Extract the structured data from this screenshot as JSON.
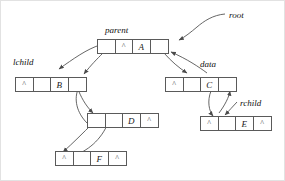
{
  "diagram": {
    "nil_glyph": "^",
    "colors": {
      "box_border": "#5a5a5a",
      "wire": "#4a4a4a",
      "text": "#111111",
      "background": "#ffffff",
      "frame": "#e2e2e2"
    },
    "annotations": [
      {
        "id": "root",
        "text": "root",
        "x": 228,
        "y": 9
      },
      {
        "id": "parent",
        "text": "parent",
        "x": 104,
        "y": 24
      },
      {
        "id": "lchild",
        "text": "lchild",
        "x": 12,
        "y": 56
      },
      {
        "id": "data",
        "text": "data",
        "x": 199,
        "y": 58
      },
      {
        "id": "rchild",
        "text": "rchild",
        "x": 239,
        "y": 97
      }
    ],
    "nodes": [
      {
        "id": "node-a",
        "data": "A",
        "x": 96,
        "y": 38,
        "cells": [
          {
            "role": "parent",
            "kind": "pointer",
            "text": ""
          },
          {
            "role": "lchild",
            "kind": "nil",
            "text": "^"
          },
          {
            "role": "data",
            "kind": "data",
            "text": "A"
          },
          {
            "role": "rchild",
            "kind": "pointer",
            "text": ""
          }
        ]
      },
      {
        "id": "node-b",
        "data": "B",
        "x": 14,
        "y": 76,
        "cells": [
          {
            "role": "parent",
            "kind": "nil",
            "text": "^"
          },
          {
            "role": "lchild",
            "kind": "pointer",
            "text": ""
          },
          {
            "role": "data",
            "kind": "data",
            "text": "B"
          },
          {
            "role": "rchild",
            "kind": "pointer",
            "text": ""
          }
        ]
      },
      {
        "id": "node-c",
        "data": "C",
        "x": 164,
        "y": 76,
        "cells": [
          {
            "role": "parent",
            "kind": "nil",
            "text": "^"
          },
          {
            "role": "lchild",
            "kind": "pointer",
            "text": ""
          },
          {
            "role": "data",
            "kind": "data",
            "text": "C"
          },
          {
            "role": "rchild",
            "kind": "pointer",
            "text": ""
          }
        ]
      },
      {
        "id": "node-d",
        "data": "D",
        "x": 86,
        "y": 112,
        "cells": [
          {
            "role": "parent",
            "kind": "pointer",
            "text": ""
          },
          {
            "role": "lchild",
            "kind": "pointer",
            "text": ""
          },
          {
            "role": "data",
            "kind": "data",
            "text": "D"
          },
          {
            "role": "rchild",
            "kind": "nil",
            "text": "^"
          }
        ]
      },
      {
        "id": "node-e",
        "data": "E",
        "x": 199,
        "y": 115,
        "cells": [
          {
            "role": "parent",
            "kind": "nil",
            "text": "^"
          },
          {
            "role": "lchild",
            "kind": "pointer",
            "text": ""
          },
          {
            "role": "data",
            "kind": "data",
            "text": "E"
          },
          {
            "role": "rchild",
            "kind": "nil",
            "text": "^"
          }
        ]
      },
      {
        "id": "node-f",
        "data": "F",
        "x": 54,
        "y": 150,
        "cells": [
          {
            "role": "parent",
            "kind": "nil",
            "text": "^"
          },
          {
            "role": "lchild",
            "kind": "pointer",
            "text": ""
          },
          {
            "role": "data",
            "kind": "data",
            "text": "F"
          },
          {
            "role": "rchild",
            "kind": "nil",
            "text": "^"
          }
        ]
      }
    ],
    "wires": [
      {
        "id": "root-to-a",
        "from": "root-label",
        "to": "node-a.rchild-area",
        "d": "M 224 13 C 212 14 203 20 196 26 C 190 31 184 36 178 39"
      },
      {
        "id": "a-parent-to-b",
        "from": "node-a.parent",
        "to": "node-b.rchild",
        "d": "M 99 44 C 86 48 72 58 58 68"
      },
      {
        "id": "a-lchild-to-b",
        "from": "node-a.lchild",
        "to": "node-b.data",
        "d": "M 102 52 C 96 58 90 64 83 73"
      },
      {
        "id": "a-rchild-to-c",
        "from": "node-a.rchild",
        "to": "node-c.data",
        "d": "M 163 52 C 170 60 178 67 186 72"
      },
      {
        "id": "c-to-a",
        "from": "node-c.parent",
        "to": "node-a.rchild",
        "d": "M 206 72 C 198 66 186 58 170 51"
      },
      {
        "id": "b-rchild-to-d",
        "from": "node-b.rchild",
        "to": "node-d.parent",
        "d": "M 76 86 C 80 96 84 104 92 112"
      },
      {
        "id": "d-parent-to-b",
        "from": "node-d.parent",
        "to": "node-b.rchild",
        "d": "M 86 122 C 76 112 72 98 78 86"
      },
      {
        "id": "d-lchild-to-f",
        "from": "node-d.lchild",
        "to": "node-f.data",
        "d": "M 92 122 C 82 132 72 142 62 151"
      },
      {
        "id": "f-to-d",
        "from": "node-f.lchild",
        "to": "node-d.lchild",
        "d": "M 72 155 C 86 150 100 140 108 120"
      },
      {
        "id": "c-lchild-to-e",
        "from": "node-c.lchild",
        "to": "node-e.parent",
        "d": "M 210 90 C 206 100 208 110 212 115"
      },
      {
        "id": "e-to-c",
        "from": "node-e.lchild",
        "to": "node-c.rchild",
        "d": "M 218 112 C 224 104 228 96 229 90"
      },
      {
        "id": "rchild-to-e",
        "from": "rchild-label",
        "to": "node-e.data",
        "d": "M 236 101 C 232 105 228 110 224 114"
      }
    ]
  }
}
